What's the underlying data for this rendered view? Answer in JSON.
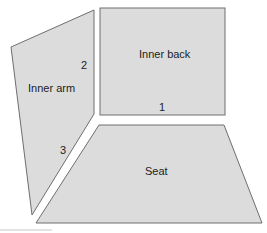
{
  "diagram": {
    "panels": [
      {
        "id": "inner-arm",
        "label": "Inner arm"
      },
      {
        "id": "inner-back",
        "label": "Inner back"
      },
      {
        "id": "seat",
        "label": "Seat"
      }
    ],
    "edge_markers": [
      "1",
      "2",
      "3"
    ],
    "colors": {
      "panel_fill": "#dcdcdc",
      "panel_stroke": "#6e6e6e",
      "text": "#222222"
    }
  }
}
